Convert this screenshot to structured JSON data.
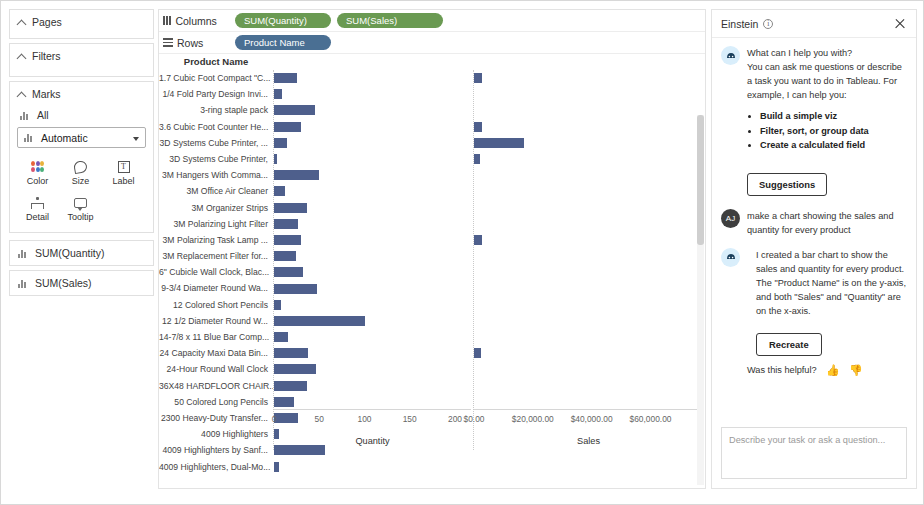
{
  "sidebar": {
    "pages": {
      "label": "Pages"
    },
    "filters": {
      "label": "Filters"
    },
    "marks": {
      "label": "Marks",
      "all_label": "All",
      "mark_type": "Automatic",
      "buttons": [
        {
          "label": "Color",
          "icon": "color-palette-icon"
        },
        {
          "label": "Size",
          "icon": "size-icon"
        },
        {
          "label": "Label",
          "icon": "label-icon"
        },
        {
          "label": "Detail",
          "icon": "detail-icon"
        },
        {
          "label": "Tooltip",
          "icon": "tooltip-icon"
        }
      ]
    },
    "measures": [
      {
        "label": "SUM(Quantity)"
      },
      {
        "label": "SUM(Sales)"
      }
    ]
  },
  "shelves": {
    "columns_label": "Columns",
    "rows_label": "Rows",
    "columns_pills": [
      "SUM(Quantity)",
      "SUM(Sales)"
    ],
    "rows_pills": [
      "Product Name"
    ]
  },
  "einstein": {
    "title": "Einstein",
    "info_glyph": "i",
    "close_label": "Close",
    "welcome": {
      "line1": "What can I help you with?",
      "line2": "You can ask me questions or describe a task you want to do in Tableau. For example, I can help you:",
      "bullets": [
        "Build a simple viz",
        "Filter, sort, or group data",
        "Create a calculated field"
      ]
    },
    "suggestions_label": "Suggestions",
    "user_initials": "AJ",
    "user_message": "make a chart showing the sales and quantity for every product",
    "bot_response": "I created a bar chart to show the sales and quantity for every product. The \"Product Name\" is on the y-axis, and both \"Sales\" and \"Quantity\" are on the x-axis.",
    "recreate_label": "Recreate",
    "helpful_label": "Was this helpful?",
    "thumb_up": "ὄD",
    "thumb_down": "ὄE",
    "input_placeholder": "Describe your task or ask a question..."
  },
  "chart_data": {
    "type": "bar",
    "title": "",
    "row_header": "Product Name",
    "bar_color": "#4e5f8c",
    "grid": false,
    "legend": "none",
    "categories": [
      "1.7 Cubic Foot Compact \"C...",
      "1/4 Fold Party Design Invi...",
      "3-ring staple pack",
      "3.6 Cubic Foot Counter He...",
      "3D Systems Cube Printer, ...",
      "3D Systems Cube Printer,",
      "3M Hangers With Comma...",
      "3M Office Air Cleaner",
      "3M Organizer Strips",
      "3M Polarizing Light Filter",
      "3M Polarizing Task Lamp ...",
      "3M Replacement Filter for...",
      "6\" Cubicle Wall Clock, Blac...",
      "9-3/4 Diameter Round Wa...",
      "12 Colored Short Pencils",
      "12 1/2 Diameter Round W...",
      "14-7/8 x 11 Blue Bar Comp...",
      "24 Capacity Maxi Data Bin...",
      "24-Hour Round Wall Clock",
      "36X48 HARDFLOOR CHAIR...",
      "50 Colored Long Pencils",
      "2300 Heavy-Duty Transfer...",
      "4009 Highlighters",
      "4009 Highlighters by Sanf...",
      "4009 Highlighters, Dual-Mo..."
    ],
    "series": [
      {
        "name": "Quantity",
        "axis": "quantity",
        "xlabel": "Quantity",
        "xlim": [
          0,
          210
        ],
        "ticks": [
          0,
          50,
          100,
          150,
          200
        ],
        "ticklabels": [
          "0",
          "50",
          "100",
          "150",
          "200"
        ],
        "values": [
          25,
          9,
          45,
          30,
          14,
          3,
          50,
          12,
          36,
          26,
          30,
          24,
          32,
          48,
          8,
          100,
          15,
          38,
          46,
          36,
          22,
          26,
          6,
          56,
          5
        ]
      },
      {
        "name": "Sales",
        "axis": "sales",
        "xlabel": "Sales",
        "xlim": [
          0,
          68000
        ],
        "ticks": [
          0,
          20000,
          40000,
          60000
        ],
        "ticklabels": [
          "$0.00",
          "$20,000.00",
          "$40,000.00",
          "$60,000.00"
        ],
        "values": [
          2600,
          0,
          0,
          2600,
          17000,
          2000,
          0,
          0,
          0,
          0,
          2600,
          0,
          0,
          0,
          0,
          0,
          0,
          2400,
          0,
          0,
          0,
          0,
          0,
          0,
          0
        ]
      }
    ]
  }
}
